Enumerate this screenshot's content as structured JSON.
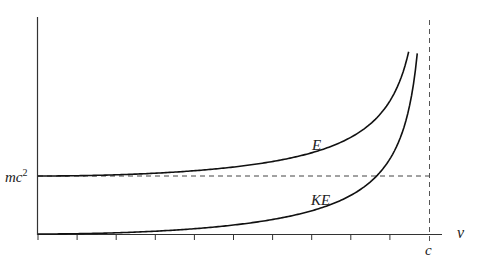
{
  "chart_data": {
    "type": "line",
    "title": "",
    "xlabel": "v",
    "ylabel": "",
    "x_tick_count": 11,
    "x_limit_label": "c",
    "y_reference_label": "mc²",
    "xlim": [
      0,
      1.0
    ],
    "ylim": [
      0,
      3.2
    ],
    "grid": false,
    "legend": "inline labels",
    "series": [
      {
        "name": "E",
        "formula": "gamma * mc^2",
        "x": [
          0,
          0.1,
          0.2,
          0.3,
          0.4,
          0.5,
          0.6,
          0.7,
          0.8,
          0.9,
          0.948
        ],
        "values": [
          1.0,
          1.005,
          1.021,
          1.048,
          1.091,
          1.155,
          1.25,
          1.4,
          1.667,
          2.294,
          3.14
        ]
      },
      {
        "name": "KE",
        "formula": "(gamma - 1) * mc^2",
        "x": [
          0,
          0.1,
          0.2,
          0.3,
          0.4,
          0.5,
          0.6,
          0.7,
          0.8,
          0.9,
          0.97
        ],
        "values": [
          0,
          0.005,
          0.021,
          0.048,
          0.091,
          0.155,
          0.25,
          0.4,
          0.667,
          1.294,
          3.11
        ]
      }
    ],
    "reference_lines": [
      {
        "orientation": "horizontal",
        "value": 1.0,
        "label": "mc²",
        "style": "dashed"
      },
      {
        "orientation": "vertical",
        "value": 1.0,
        "label": "c",
        "style": "dashed"
      }
    ]
  },
  "labels": {
    "E": "E",
    "KE": "KE",
    "mc2_base": "mc",
    "mc2_exp": "2",
    "v": "v",
    "c": "c"
  }
}
